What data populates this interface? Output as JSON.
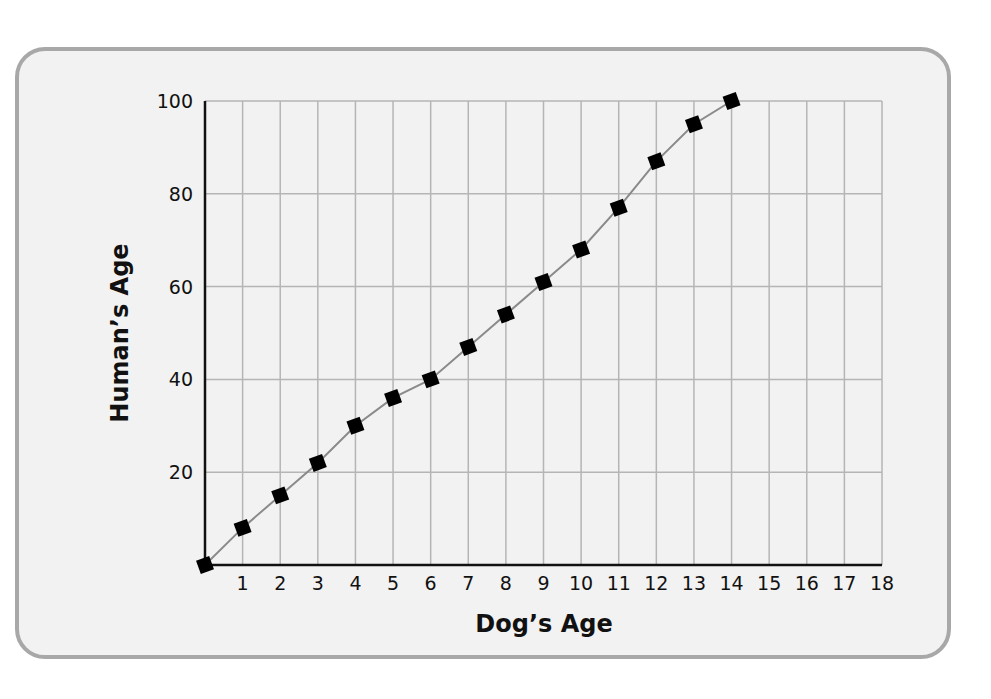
{
  "chart_data": {
    "type": "line",
    "title": "",
    "xlabel": "Dog’s Age",
    "ylabel": "Human’s Age",
    "x": [
      0,
      1,
      2,
      3,
      4,
      5,
      6,
      7,
      8,
      9,
      10,
      11,
      12,
      13,
      14
    ],
    "series": [
      {
        "name": "Human's Age",
        "values": [
          0,
          8,
          15,
          22,
          30,
          36,
          40,
          47,
          54,
          61,
          68,
          77,
          87,
          95,
          100
        ],
        "marker": "square",
        "line_color": "#8a8a8a",
        "marker_color": "#000000"
      }
    ],
    "xlim": [
      0,
      18
    ],
    "ylim": [
      0,
      100
    ],
    "xticks": [
      "1",
      "2",
      "3",
      "4",
      "5",
      "6",
      "7",
      "8",
      "9",
      "10",
      "11",
      "12",
      "13",
      "14",
      "15",
      "16",
      "17",
      "18"
    ],
    "yticks": [
      "20",
      "40",
      "60",
      "80",
      "100"
    ],
    "grid": true,
    "legend": "none"
  },
  "colors": {
    "background": "#f2f2f2",
    "frame_border": "#a8a8a8",
    "grid": "#b5b5b5",
    "axis": "#111111"
  }
}
